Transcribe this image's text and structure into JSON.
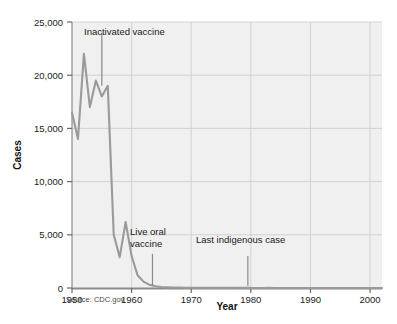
{
  "chart_data": {
    "type": "line",
    "title": "",
    "xlabel": "Year",
    "ylabel": "Cases",
    "xlim": [
      1950,
      2002
    ],
    "ylim": [
      0,
      25000
    ],
    "grid": true,
    "legend": "none",
    "line_color": "#9a9a9a",
    "plot_background": "#f0f0f0",
    "grid_color": "#d2d2d2",
    "axis_color": "#7a7a7a",
    "x_ticks": [
      1950,
      1960,
      1970,
      1980,
      1990,
      2000
    ],
    "x_tick_labels": [
      "1950",
      "1960",
      "1970",
      "1980",
      "1990",
      "2000"
    ],
    "y_ticks": [
      0,
      5000,
      10000,
      15000,
      20000,
      25000
    ],
    "y_tick_labels": [
      "0",
      "5,000",
      "10,000",
      "15,000",
      "20,000",
      "25,000"
    ],
    "x": [
      1950,
      1951,
      1952,
      1953,
      1954,
      1955,
      1956,
      1957,
      1958,
      1959,
      1960,
      1961,
      1962,
      1963,
      1964,
      1965,
      1966,
      1967,
      1968,
      1969,
      1970,
      1971,
      1972,
      1973,
      1974,
      1975,
      1976,
      1977,
      1978,
      1979,
      1980,
      1981,
      1982,
      1983,
      1984,
      1985,
      1986,
      1987,
      1988,
      1989,
      1990,
      1991,
      1992,
      1993,
      1994,
      1995,
      1996,
      1997,
      1998,
      1999,
      2000,
      2001,
      2002
    ],
    "y": [
      16500,
      14000,
      22000,
      17000,
      19500,
      18000,
      19000,
      5000,
      2900,
      6200,
      3000,
      1200,
      600,
      300,
      160,
      90,
      60,
      40,
      50,
      25,
      30,
      20,
      30,
      15,
      10,
      10,
      15,
      20,
      15,
      30,
      10,
      5,
      5,
      10,
      5,
      5,
      5,
      5,
      5,
      5,
      5,
      5,
      5,
      5,
      5,
      5,
      5,
      5,
      5,
      5,
      5,
      5,
      5
    ],
    "series_name": "Polio cases",
    "annotations": [
      {
        "id": "inactivated-vaccine",
        "label": "Inactivated vaccine",
        "label_line1": "Inactivated vaccine",
        "label_line2": "",
        "pointer_year": 1955,
        "pointer_value_top": 24000,
        "pointer_value_bottom": 19000
      },
      {
        "id": "live-oral-vaccine",
        "label": "Live oral vaccine",
        "label_line1": "Live oral",
        "label_line2": "vaccine",
        "pointer_year": 1963.5,
        "pointer_value_top": 3200,
        "pointer_value_bottom": 200
      },
      {
        "id": "last-indigenous-case",
        "label": "Last indigenous case",
        "label_line1": "Last indigenous case",
        "label_line2": "",
        "pointer_year": 1979.5,
        "pointer_value_top": 3000,
        "pointer_value_bottom": 200
      }
    ],
    "source": "Source: CDC.gov"
  }
}
